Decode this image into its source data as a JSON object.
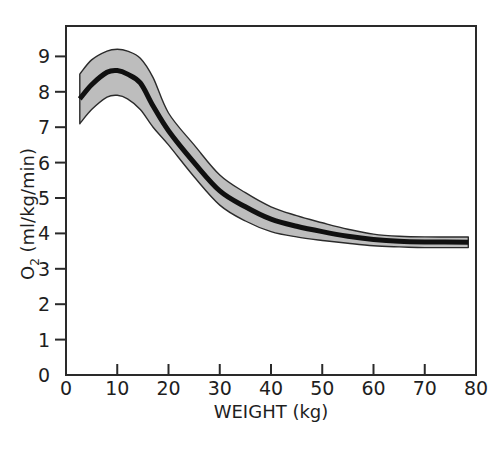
{
  "chart_data": {
    "type": "area",
    "title": "",
    "xlabel": "WEIGHT (kg)",
    "ylabel_main": "O",
    "ylabel_sub": "2",
    "ylabel_rest": " (ml/kg/min)",
    "ylabel": "O2 (ml/kg/min)",
    "xlim": [
      0,
      80
    ],
    "ylim": [
      0,
      10
    ],
    "grid": false,
    "legend": null,
    "x_ticks": [
      0,
      10,
      20,
      30,
      40,
      50,
      60,
      70,
      80
    ],
    "x_tick_labels": [
      "0",
      "10",
      "20",
      "30",
      "40",
      "50",
      "60",
      "70",
      "80"
    ],
    "y_ticks": [
      0,
      1,
      2,
      3,
      4,
      5,
      6,
      7,
      8,
      9
    ],
    "y_tick_labels": [
      "0",
      "1",
      "2",
      "3",
      "4",
      "5",
      "6",
      "7",
      "8",
      "9"
    ],
    "series": [
      {
        "name": "mean",
        "style": "thick black line",
        "x": [
          2.7,
          5,
          8,
          10,
          12,
          14.5,
          17,
          20,
          25,
          30,
          35,
          40,
          45,
          50,
          55,
          60,
          65,
          70,
          78.5
        ],
        "values": [
          7.8,
          8.2,
          8.55,
          8.6,
          8.5,
          8.25,
          7.6,
          6.9,
          6.0,
          5.2,
          4.75,
          4.4,
          4.2,
          4.05,
          3.92,
          3.83,
          3.78,
          3.76,
          3.75
        ]
      },
      {
        "name": "upper bound",
        "style": "shaded band upper edge",
        "x": [
          2.7,
          5,
          8,
          10,
          12,
          14.5,
          17,
          20,
          25,
          30,
          35,
          40,
          45,
          50,
          55,
          60,
          65,
          70,
          78.5
        ],
        "values": [
          8.5,
          8.9,
          9.15,
          9.2,
          9.15,
          8.95,
          8.4,
          7.4,
          6.5,
          5.65,
          5.15,
          4.75,
          4.5,
          4.3,
          4.12,
          3.98,
          3.92,
          3.9,
          3.9
        ]
      },
      {
        "name": "lower bound",
        "style": "shaded band lower edge",
        "x": [
          2.7,
          5,
          8,
          10,
          12,
          14.5,
          17,
          20,
          25,
          30,
          35,
          40,
          45,
          50,
          55,
          60,
          65,
          70,
          78.5
        ],
        "values": [
          7.1,
          7.5,
          7.85,
          7.9,
          7.8,
          7.5,
          7.0,
          6.5,
          5.6,
          4.8,
          4.35,
          4.05,
          3.9,
          3.8,
          3.72,
          3.65,
          3.62,
          3.6,
          3.6
        ]
      }
    ],
    "colors": {
      "band_fill": "#bdbdbd",
      "line": "#101010",
      "axes": "#2a2a2a"
    }
  }
}
